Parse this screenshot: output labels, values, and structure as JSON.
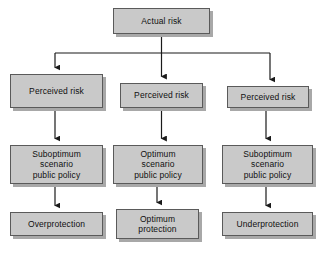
{
  "diagram": {
    "colors": {
      "box_fill": "#c9c9c9",
      "box_border": "#5a5a5a",
      "box_shadow": "#a8a8a8",
      "connector": "#1a1a1a",
      "background": "#ffffff",
      "text": "#101010"
    },
    "nodes": {
      "actual_risk": "Actual risk",
      "perceived_risk_left": "Perceived risk",
      "perceived_risk_center": "Perceived risk",
      "perceived_risk_right": "Perceived risk",
      "policy_left": "Suboptimum\nscenario\npublic policy",
      "policy_center": "Optimum\nscenario\npublic policy",
      "policy_right": "Suboptimum\nscenario\npublic policy",
      "outcome_left": "Overprotection",
      "outcome_center": "Optimum\nprotection",
      "outcome_right": "Underprotection"
    },
    "edges": [
      {
        "from": "actual_risk",
        "to": "perceived_risk_left",
        "type": "elbow-arrow"
      },
      {
        "from": "actual_risk",
        "to": "perceived_risk_center",
        "type": "straight-arrow"
      },
      {
        "from": "actual_risk",
        "to": "perceived_risk_right",
        "type": "elbow-arrow"
      },
      {
        "from": "perceived_risk_left",
        "to": "policy_left",
        "type": "straight-arrow"
      },
      {
        "from": "perceived_risk_center",
        "to": "policy_center",
        "type": "straight-arrow"
      },
      {
        "from": "perceived_risk_right",
        "to": "policy_right",
        "type": "straight-arrow"
      },
      {
        "from": "policy_left",
        "to": "outcome_left",
        "type": "straight-arrow"
      },
      {
        "from": "policy_center",
        "to": "outcome_center",
        "type": "straight-arrow"
      },
      {
        "from": "policy_right",
        "to": "outcome_right",
        "type": "straight-arrow"
      }
    ]
  }
}
